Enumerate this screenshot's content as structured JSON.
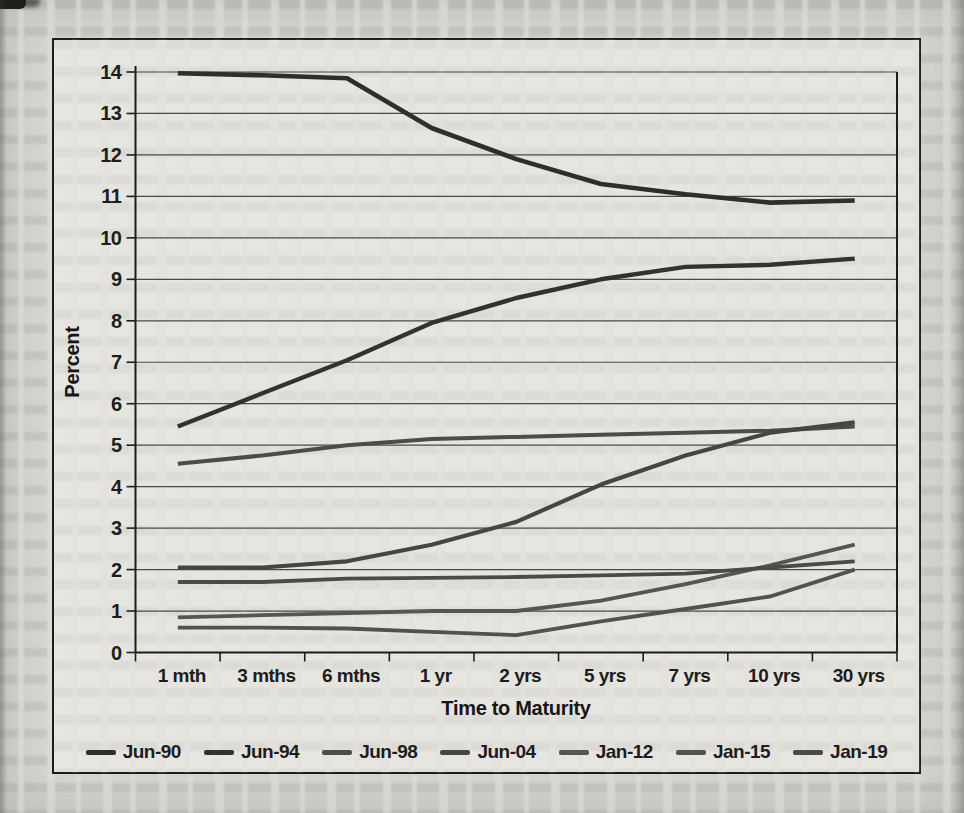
{
  "page": {
    "background": "#d8d7d2"
  },
  "chart_data": {
    "type": "line",
    "title": "",
    "xlabel": "Time to Maturity",
    "ylabel": "Percent",
    "ylim": [
      0,
      14
    ],
    "ytick_step": 1,
    "ytick_labels": [
      "0",
      "1",
      "2",
      "3",
      "4",
      "5",
      "6",
      "7",
      "8",
      "9",
      "10",
      "11",
      "12",
      "13",
      "14"
    ],
    "grid": "horizontal",
    "legend_position": "bottom",
    "categories": [
      "1 mth",
      "3 mths",
      "6 mths",
      "1 yr",
      "2 yrs",
      "5 yrs",
      "7 yrs",
      "10 yrs",
      "30 yrs"
    ],
    "series": [
      {
        "name": "Jun-90",
        "color": "#2e2e2c",
        "width": 4.6,
        "values": [
          13.97,
          13.92,
          13.85,
          12.65,
          11.9,
          11.3,
          11.05,
          10.85,
          10.9
        ]
      },
      {
        "name": "Jun-94",
        "color": "#323230",
        "width": 4.4,
        "values": [
          5.45,
          6.25,
          7.05,
          7.95,
          8.55,
          9.0,
          9.3,
          9.35,
          9.5
        ]
      },
      {
        "name": "Jun-98",
        "color": "#4c4c48",
        "width": 4.0,
        "values": [
          4.55,
          4.75,
          5.0,
          5.15,
          5.2,
          5.25,
          5.3,
          5.35,
          5.45
        ]
      },
      {
        "name": "Jun-04",
        "color": "#454543",
        "width": 4.2,
        "values": [
          2.05,
          2.05,
          2.2,
          2.6,
          3.15,
          4.05,
          4.75,
          5.3,
          5.55
        ]
      },
      {
        "name": "Jan-12",
        "color": "#555551",
        "width": 3.8,
        "values": [
          0.85,
          0.9,
          0.95,
          1.0,
          1.0,
          1.25,
          1.65,
          2.1,
          2.6
        ]
      },
      {
        "name": "Jan-15",
        "color": "#51514d",
        "width": 3.8,
        "values": [
          0.6,
          0.6,
          0.58,
          0.5,
          0.42,
          0.75,
          1.05,
          1.35,
          2.0
        ]
      },
      {
        "name": "Jan-19",
        "color": "#4a4a46",
        "width": 3.8,
        "values": [
          1.7,
          1.7,
          1.78,
          1.8,
          1.82,
          1.86,
          1.9,
          2.05,
          2.2
        ]
      }
    ]
  }
}
